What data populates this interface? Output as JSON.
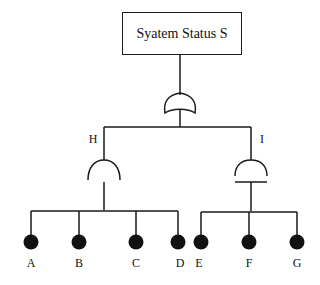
{
  "diagram": {
    "type": "fault-tree",
    "top_event": {
      "label": "Syatem Status S",
      "gate": "OR"
    },
    "intermediate_events": [
      {
        "id": "H",
        "label": "H",
        "gate": "AND",
        "inputs": [
          "A",
          "B",
          "C",
          "D"
        ]
      },
      {
        "id": "I",
        "label": "I",
        "gate": "AND",
        "inputs": [
          "E",
          "F",
          "G"
        ]
      }
    ],
    "basic_events": [
      {
        "label": "A"
      },
      {
        "label": "B"
      },
      {
        "label": "C"
      },
      {
        "label": "D"
      },
      {
        "label": "E"
      },
      {
        "label": "F"
      },
      {
        "label": "G"
      }
    ],
    "colors": {
      "line": "#1a1a1a",
      "background": "#ffffff"
    }
  }
}
